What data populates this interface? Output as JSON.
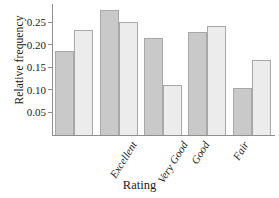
{
  "chart_data": {
    "type": "bar",
    "title": "",
    "xlabel": "Rating",
    "ylabel": "Relative frequency",
    "categories": [
      "Excellent",
      "Very Good",
      "Good",
      "Fair",
      "Poor"
    ],
    "series": [
      {
        "name": "series-1",
        "color": "#c9c9c9",
        "values": [
          0.185,
          0.276,
          0.215,
          0.228,
          0.103
        ]
      },
      {
        "name": "series-2",
        "color": "#ececec",
        "values": [
          0.233,
          0.25,
          0.11,
          0.241,
          0.167
        ]
      }
    ],
    "yticks": [
      0.05,
      0.1,
      0.15,
      0.2,
      0.25
    ],
    "ytick_labels": [
      "0.05",
      "0.10",
      "0.15",
      "0.20",
      "0.25"
    ],
    "ylim": [
      0,
      0.29
    ],
    "grid": false,
    "legend": "none",
    "axis_color": "#8f8f8f"
  }
}
